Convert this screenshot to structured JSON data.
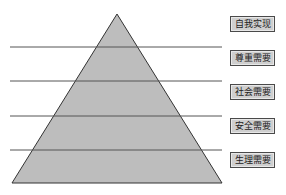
{
  "diagram": {
    "fill_color": "#bdbdbd",
    "stroke_color": "#333333",
    "levels": [
      {
        "label": "自我实现",
        "y": 16
      },
      {
        "label": "尊重需要",
        "y": 50
      },
      {
        "label": "社会需要",
        "y": 84
      },
      {
        "label": "安全需要",
        "y": 118
      },
      {
        "label": "生理需要",
        "y": 152
      }
    ],
    "divider_lines_y": [
      47,
      81,
      116,
      150
    ]
  }
}
